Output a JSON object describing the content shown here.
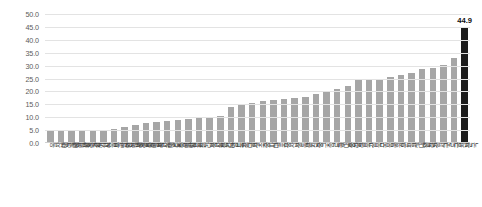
{
  "chart_data": {
    "type": "bar",
    "title": "",
    "subtitle": "",
    "xlabel": "",
    "ylabel": "",
    "ylim": [
      0.0,
      50.0
    ],
    "ytick_step": 5.0,
    "yticks": [
      "50.0",
      "45.0",
      "40.0",
      "35.0",
      "30.0",
      "25.0",
      "20.0",
      "15.0",
      "10.0",
      "5.0",
      "0.0"
    ],
    "grid": true,
    "legend": "none",
    "sorted": "ascending",
    "bar_color": "#a6a6a6",
    "highlight_color": "#1c1c1c",
    "highlight_index": 39,
    "value_label_shown_for": "전국",
    "value_label_text": "44.9",
    "categories": [
      "울산광역시",
      "대구광역시",
      "대전광역시",
      "광주광역시",
      "경기도",
      "서울특별시",
      "부산광역시",
      "인천광역시",
      "세종특별시",
      "충청북도",
      "경상남도",
      "제주특별시",
      "충청남도",
      "강원도",
      "전라북도",
      "경상북도",
      "전라남도",
      "영등포구",
      "강남구",
      "서초구",
      "송파구",
      "마포구",
      "용산구",
      "성동구",
      "광진구",
      "중구",
      "종로구",
      "동대문구",
      "중랑구",
      "성북구",
      "강북구",
      "도봉구",
      "노원구",
      "은평구",
      "서대문구",
      "양천구",
      "강서구",
      "구로구",
      "금천구",
      "전국"
    ],
    "values": [
      4.6,
      4.7,
      4.8,
      4.9,
      5.0,
      5.2,
      5.4,
      6.2,
      7.0,
      7.6,
      8.2,
      8.6,
      9.0,
      9.4,
      9.8,
      10.2,
      10.6,
      13.8,
      14.6,
      15.4,
      16.4,
      16.8,
      17.2,
      17.6,
      18.0,
      19.0,
      20.0,
      21.0,
      22.2,
      24.6,
      24.8,
      24.9,
      25.4,
      26.2,
      27.2,
      28.6,
      29.2,
      30.2,
      33.0,
      44.9
    ]
  }
}
